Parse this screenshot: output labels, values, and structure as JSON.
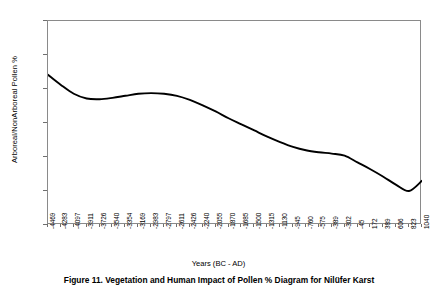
{
  "chart_data": {
    "type": "line",
    "title": "",
    "xlabel": "Years (BC - AD)",
    "ylabel": "Arboreal/NonArboreal Pollen %",
    "ylim": [
      0,
      30
    ],
    "yticks": [
      0,
      5,
      10,
      15,
      20,
      25,
      30
    ],
    "ytick_labels": [
      "0",
      "5",
      "10",
      "15",
      "20",
      "25",
      "30"
    ],
    "grid": false,
    "legend": "none",
    "line_color": "#000000",
    "frame_color": "#8a8a8a",
    "xtick_labels": [
      "-4469",
      "-4283",
      "-4097",
      "-3911",
      "-3726",
      "-3540",
      "-3354",
      "-3169",
      "-2983",
      "-2797",
      "-2611",
      "-2426",
      "-2240",
      "-2055",
      "-1870",
      "-1685",
      "-1500",
      "-1315",
      "-1130",
      "-945",
      "-760",
      "-575",
      "-389",
      "-302",
      "-45",
      "172",
      "389",
      "606",
      "823",
      "1040"
    ],
    "x": [
      -4469,
      -4283,
      -4097,
      -3911,
      -3726,
      -3540,
      -3354,
      -3169,
      -2983,
      -2797,
      -2611,
      -2426,
      -2240,
      -2055,
      -1870,
      -1685,
      -1500,
      -1315,
      -1130,
      -945,
      -760,
      -575,
      -389,
      -302,
      -45,
      172,
      389,
      606,
      823,
      1040
    ],
    "values": [
      22.1,
      20.6,
      19.3,
      18.6,
      18.5,
      18.7,
      19.0,
      19.3,
      19.4,
      19.3,
      19.0,
      18.4,
      17.6,
      16.7,
      15.7,
      14.8,
      13.9,
      13.0,
      12.2,
      11.5,
      11.0,
      10.7,
      10.5,
      10.2,
      9.2,
      8.2,
      7.1,
      5.9,
      5.0,
      6.5
    ],
    "series_name": "Arboreal/NonArboreal Pollen %"
  },
  "axis": {
    "x_title": "Years (BC - AD)",
    "y_title": "Arboreal/NonArboreal Pollen %"
  },
  "caption": {
    "text": "Figure 11. Vegetation and Human Impact of Pollen % Diagram for Nilüfer Karst"
  }
}
